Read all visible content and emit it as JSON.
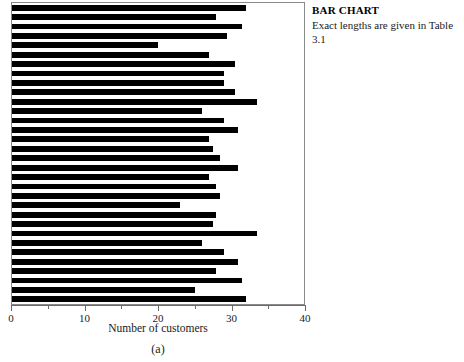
{
  "annotation": {
    "title": "BAR CHART",
    "body": "Exact lengths are given in Table 3.1"
  },
  "axis": {
    "title": "Number of customers",
    "caption": "(a)",
    "tick_labels": [
      "0",
      "10",
      "20",
      "30",
      "40"
    ]
  },
  "chart_data": {
    "type": "bar",
    "orientation": "horizontal",
    "title": "",
    "xlabel": "Number of customers",
    "ylabel": "",
    "xlim": [
      0,
      40
    ],
    "xticks": [
      0,
      10,
      20,
      30,
      40
    ],
    "minor_xticks": [
      5,
      15,
      25,
      35
    ],
    "grid": false,
    "legend": null,
    "bar_color": "#000000",
    "frame_color": "#8a8a8a",
    "categories": [
      "1",
      "2",
      "3",
      "4",
      "5",
      "6",
      "7",
      "8",
      "9",
      "10",
      "11",
      "12",
      "13",
      "14",
      "15",
      "16",
      "17",
      "18",
      "19",
      "20",
      "21",
      "22",
      "23",
      "24",
      "25",
      "26",
      "27",
      "28",
      "29",
      "30",
      "31",
      "32"
    ],
    "values": [
      32.0,
      28.0,
      31.5,
      29.5,
      20.0,
      27.0,
      30.5,
      29.0,
      29.0,
      30.5,
      33.5,
      26.0,
      29.0,
      31.0,
      27.0,
      27.5,
      28.5,
      31.0,
      27.0,
      28.0,
      28.5,
      23.0,
      28.0,
      27.5,
      33.5,
      26.0,
      29.0,
      31.0,
      28.0,
      31.5,
      25.0,
      32.0
    ]
  }
}
